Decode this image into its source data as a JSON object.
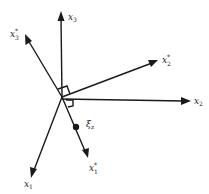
{
  "diagram": {
    "axes": [
      {
        "id": "x3",
        "symbol": "x",
        "subscript": "3",
        "superscript": ""
      },
      {
        "id": "x3_star",
        "symbol": "x",
        "subscript": "3",
        "superscript": "*"
      },
      {
        "id": "x2_star",
        "symbol": "x",
        "subscript": "2",
        "superscript": "*"
      },
      {
        "id": "x2",
        "symbol": "x",
        "subscript": "2",
        "superscript": ""
      },
      {
        "id": "x1_star",
        "symbol": "x",
        "subscript": "1",
        "superscript": "*"
      },
      {
        "id": "x1",
        "symbol": "x",
        "subscript": "1",
        "superscript": ""
      }
    ],
    "point": {
      "symbol": "ξ",
      "subscript": "z"
    },
    "colors": {
      "ink": "#1a1a1a",
      "background": "#ffffff"
    }
  }
}
